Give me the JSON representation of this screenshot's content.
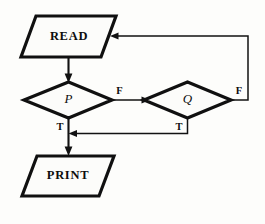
{
  "diagram": {
    "type": "flowchart",
    "background_color": "#fdfdfb",
    "stroke_color": "#121212",
    "nodes": [
      {
        "id": "read",
        "shape": "parallelogram",
        "role": "input",
        "label": "READ"
      },
      {
        "id": "p",
        "shape": "diamond",
        "role": "decision",
        "label": "P"
      },
      {
        "id": "q",
        "shape": "diamond",
        "role": "decision",
        "label": "Q"
      },
      {
        "id": "print",
        "shape": "parallelogram",
        "role": "output",
        "label": "PRINT"
      }
    ],
    "branch_labels": {
      "p_false": "F",
      "p_true": "T",
      "q_false": "F",
      "q_true": "T"
    },
    "edges": [
      {
        "id": "read-to-p",
        "from": "read",
        "to": "p",
        "label": ""
      },
      {
        "id": "p-false-to-q",
        "from": "p",
        "to": "q",
        "label": "F"
      },
      {
        "id": "p-true-to-print",
        "from": "p",
        "to": "print",
        "label": "T"
      },
      {
        "id": "q-false-to-read",
        "from": "q",
        "to": "read",
        "label": "F"
      },
      {
        "id": "q-true-to-print",
        "from": "q",
        "to": "print",
        "label": "T"
      }
    ]
  }
}
